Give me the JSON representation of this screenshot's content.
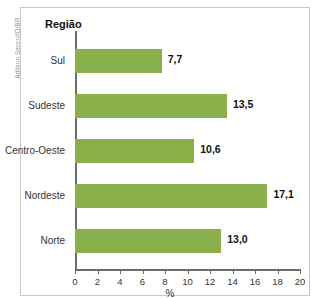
{
  "credit": "Adilson Secco/ID/BR",
  "title_sliver": "",
  "axes": {
    "y_title": "Região",
    "x_label": "%"
  },
  "chart_data": {
    "type": "bar",
    "orientation": "horizontal",
    "title": "",
    "xlabel": "%",
    "ylabel": "Região",
    "categories": [
      "Sul",
      "Sudeste",
      "Centro-Oeste",
      "Nordeste",
      "Norte"
    ],
    "values": [
      7.7,
      13.5,
      10.6,
      17.1,
      13.0
    ],
    "value_labels": [
      "7,7",
      "13,5",
      "10,6",
      "17,1",
      "13,0"
    ],
    "xlim": [
      0,
      20
    ],
    "xticks": [
      0,
      2,
      4,
      6,
      8,
      10,
      12,
      14,
      16,
      18,
      20
    ],
    "xtick_labels": [
      "0",
      "2",
      "4",
      "6",
      "8",
      "10",
      "12",
      "14",
      "16",
      "18",
      "20"
    ],
    "grid": false,
    "legend": "none",
    "bar_color": "#8AB04C",
    "axis_color": "#6c6c6c",
    "text_color": "#333333"
  }
}
